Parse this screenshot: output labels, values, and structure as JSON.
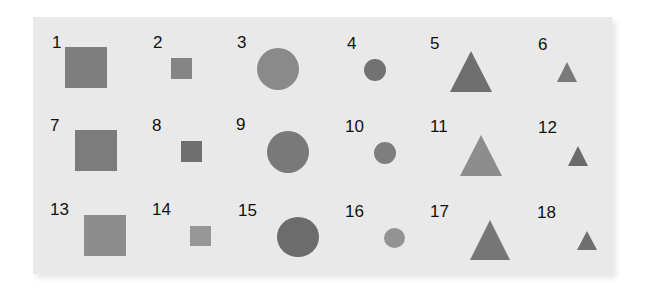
{
  "figure": {
    "background": "#e9e9e9",
    "items": [
      {
        "id": "1",
        "label": "1",
        "shape": "square",
        "size": "large",
        "color": "#7f7f7f",
        "lx": 52,
        "ly": 42,
        "x": 65,
        "y": 47,
        "w": 42,
        "h": 41
      },
      {
        "id": "2",
        "label": "2",
        "shape": "square",
        "size": "small",
        "color": "#858585",
        "lx": 153,
        "ly": 42,
        "x": 171,
        "y": 58,
        "w": 21,
        "h": 21
      },
      {
        "id": "3",
        "label": "3",
        "shape": "circle",
        "size": "large",
        "color": "#8a8a8a",
        "lx": 237,
        "ly": 42,
        "x": 257,
        "y": 48,
        "w": 42,
        "h": 42
      },
      {
        "id": "4",
        "label": "4",
        "shape": "circle",
        "size": "small",
        "color": "#727272",
        "lx": 347,
        "ly": 43,
        "x": 364,
        "y": 59,
        "w": 22,
        "h": 22
      },
      {
        "id": "5",
        "label": "5",
        "shape": "triangle",
        "size": "large",
        "color": "#6f6f6f",
        "lx": 430,
        "ly": 43,
        "x": 450,
        "y": 51,
        "w": 42,
        "h": 41
      },
      {
        "id": "6",
        "label": "6",
        "shape": "triangle",
        "size": "small",
        "color": "#7a7a7a",
        "lx": 538,
        "ly": 44,
        "x": 557,
        "y": 62,
        "w": 21,
        "h": 20
      },
      {
        "id": "7",
        "label": "7",
        "shape": "square",
        "size": "large",
        "color": "#7c7c7c",
        "lx": 50,
        "ly": 125,
        "x": 75,
        "y": 130,
        "w": 42,
        "h": 41
      },
      {
        "id": "8",
        "label": "8",
        "shape": "square",
        "size": "small",
        "color": "#6f6f6f",
        "lx": 152,
        "ly": 125,
        "x": 181,
        "y": 141,
        "w": 21,
        "h": 21
      },
      {
        "id": "9",
        "label": "9",
        "shape": "circle",
        "size": "large",
        "color": "#797979",
        "lx": 236,
        "ly": 124,
        "x": 267,
        "y": 131,
        "w": 42,
        "h": 42
      },
      {
        "id": "10",
        "label": "10",
        "shape": "circle",
        "size": "small",
        "color": "#7e7e7e",
        "lx": 345,
        "ly": 126,
        "x": 374,
        "y": 142,
        "w": 22,
        "h": 22
      },
      {
        "id": "11",
        "label": "11",
        "shape": "triangle",
        "size": "large",
        "color": "#8d8d8d",
        "lx": 430,
        "ly": 126,
        "x": 460,
        "y": 135,
        "w": 42,
        "h": 41
      },
      {
        "id": "12",
        "label": "12",
        "shape": "triangle",
        "size": "small",
        "color": "#6a6a6a",
        "lx": 538,
        "ly": 127,
        "x": 568,
        "y": 146,
        "w": 20,
        "h": 20
      },
      {
        "id": "13",
        "label": "13",
        "shape": "square",
        "size": "large",
        "color": "#8d8d8d",
        "lx": 50,
        "ly": 209,
        "x": 84,
        "y": 215,
        "w": 42,
        "h": 41
      },
      {
        "id": "14",
        "label": "14",
        "shape": "square",
        "size": "small",
        "color": "#979797",
        "lx": 152,
        "ly": 209,
        "x": 190,
        "y": 226,
        "w": 21,
        "h": 20
      },
      {
        "id": "15",
        "label": "15",
        "shape": "circle",
        "size": "large",
        "color": "#6c6c6c",
        "lx": 238,
        "ly": 210,
        "x": 277,
        "y": 217,
        "w": 42,
        "h": 40
      },
      {
        "id": "16",
        "label": "16",
        "shape": "circle",
        "size": "small",
        "color": "#939393",
        "lx": 345,
        "ly": 211,
        "x": 384,
        "y": 228,
        "w": 21,
        "h": 20
      },
      {
        "id": "17",
        "label": "17",
        "shape": "triangle",
        "size": "large",
        "color": "#767676",
        "lx": 430,
        "ly": 211,
        "x": 470,
        "y": 220,
        "w": 41,
        "h": 40
      },
      {
        "id": "18",
        "label": "18",
        "shape": "triangle",
        "size": "small",
        "color": "#6f6f6f",
        "lx": 537,
        "ly": 212,
        "x": 577,
        "y": 231,
        "w": 20,
        "h": 19
      }
    ]
  }
}
